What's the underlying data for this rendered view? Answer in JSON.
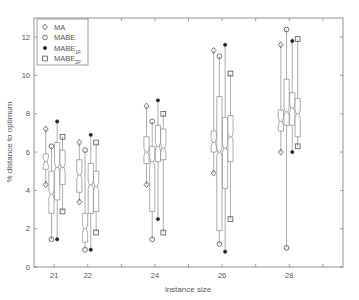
{
  "chart_data": {
    "type": "boxplot",
    "title": "",
    "xlabel": "instance size",
    "ylabel": "% distance to optimum",
    "categories": [
      "21",
      "22",
      "24",
      "26",
      "28"
    ],
    "x": [
      21,
      22,
      24,
      26,
      28
    ],
    "xlim": [
      20.4,
      29.6
    ],
    "ylim": [
      0,
      13
    ],
    "xticks": [
      21,
      22,
      23,
      24,
      25,
      26,
      27,
      28,
      29
    ],
    "xtick_labels": [
      "21",
      "22",
      "",
      "24",
      "",
      "26",
      "",
      "28",
      ""
    ],
    "yticks": [
      0,
      2,
      4,
      6,
      8,
      10,
      12
    ],
    "ytick_labels": [
      "0",
      "2",
      "4",
      "6",
      "8",
      "10",
      "12"
    ],
    "grid": false,
    "legend_position": "upper left",
    "series": [
      {
        "name": "MA",
        "marker": "diamond",
        "offset": -0.25,
        "min": [
          4.3,
          3.4,
          4.3,
          4.9,
          6.0
        ],
        "q1": [
          5.1,
          3.9,
          5.4,
          6.0,
          7.1
        ],
        "median": [
          5.5,
          4.8,
          6.0,
          6.5,
          7.6
        ],
        "q3": [
          5.9,
          5.6,
          6.8,
          7.1,
          8.2
        ],
        "max": [
          7.2,
          6.5,
          8.4,
          11.3,
          11.6
        ]
      },
      {
        "name": "MABE",
        "marker": "circle",
        "offset": -0.08,
        "min": [
          1.45,
          0.9,
          1.45,
          1.2,
          1.0
        ],
        "q1": [
          2.8,
          1.3,
          2.9,
          1.9,
          7.4
        ],
        "median": [
          3.8,
          2.0,
          5.5,
          6.0,
          8.1
        ],
        "q3": [
          5.0,
          2.8,
          6.3,
          8.9,
          9.8
        ],
        "max": [
          6.3,
          6.1,
          7.6,
          11.0,
          12.4
        ]
      },
      {
        "name": "MABE_1F",
        "label_main": "MABE",
        "label_sub": "1F",
        "marker": "star",
        "offset": 0.09,
        "min": [
          1.45,
          0.9,
          2.5,
          0.8,
          6.0
        ],
        "q1": [
          3.5,
          2.8,
          5.5,
          4.1,
          7.4
        ],
        "median": [
          5.2,
          4.3,
          6.3,
          6.2,
          8.3
        ],
        "q3": [
          6.5,
          5.4,
          7.4,
          7.8,
          9.1
        ],
        "max": [
          7.6,
          6.9,
          8.7,
          11.6,
          11.8
        ]
      },
      {
        "name": "MABE_2F",
        "label_main": "MABE",
        "label_sub": "2F",
        "marker": "square",
        "offset": 0.25,
        "min": [
          2.9,
          1.8,
          1.8,
          2.5,
          6.3
        ],
        "q1": [
          4.3,
          2.9,
          5.6,
          5.5,
          6.8
        ],
        "median": [
          5.2,
          4.2,
          6.2,
          6.8,
          8.0
        ],
        "q3": [
          6.1,
          5.0,
          7.2,
          7.9,
          8.8
        ],
        "max": [
          6.8,
          6.5,
          8.0,
          10.1,
          11.9
        ]
      }
    ]
  },
  "legend": {
    "items": [
      {
        "main": "MA",
        "sub": ""
      },
      {
        "main": "MABE",
        "sub": ""
      },
      {
        "main": "MABE",
        "sub": "1F"
      },
      {
        "main": "MABE",
        "sub": "2F"
      }
    ]
  },
  "colors": {
    "axis": "#7a7a7a",
    "box": "#8a8a8a",
    "text": "#555555",
    "marker_fill_star": "#222222"
  }
}
